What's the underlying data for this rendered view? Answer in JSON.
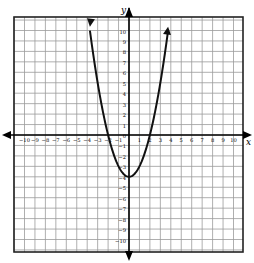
{
  "chart_data": {
    "type": "line",
    "title": "",
    "function": "y = x^2 - 4",
    "xlabel": "x",
    "ylabel": "y",
    "xlim": [
      -11,
      11
    ],
    "ylim": [
      -11,
      11
    ],
    "grid": true,
    "x_tick_labels": [
      "-10",
      "-9",
      "-8",
      "-7",
      "-6",
      "-5",
      "-4",
      "-3",
      "-2",
      "-1",
      "1",
      "2",
      "3",
      "4",
      "5",
      "6",
      "7",
      "8",
      "9",
      "10"
    ],
    "y_tick_labels": [
      "10",
      "9",
      "8",
      "7",
      "6",
      "5",
      "4",
      "3",
      "2",
      "1",
      "0",
      "-1",
      "-2",
      "-3",
      "-4",
      "-5",
      "-6",
      "-7",
      "-8",
      "-9",
      "-10"
    ],
    "series": [
      {
        "name": "parabola",
        "x": [
          -3.74,
          -3,
          -2,
          -1,
          0,
          1,
          2,
          3,
          3.74
        ],
        "y": [
          10,
          5,
          0,
          -3,
          -4,
          -3,
          0,
          5,
          10
        ]
      }
    ],
    "vertex": [
      0,
      -4
    ],
    "x_intercepts": [
      -2,
      2
    ],
    "arrows_on_curve_ends": true,
    "colors": {
      "grid": "#9a9a9a",
      "axis": "#000000",
      "curve": "#111111",
      "border": "#222222"
    }
  }
}
